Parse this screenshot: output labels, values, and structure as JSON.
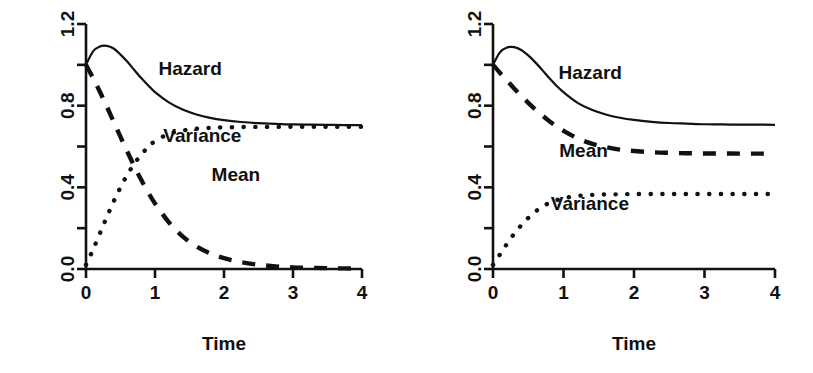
{
  "figure": {
    "title": "",
    "panel_count": 2,
    "background": "#ffffff",
    "ink_color": "#111111"
  },
  "chart_data": [
    {
      "type": "line",
      "panel": "left",
      "title": "",
      "xlabel": "Time",
      "ylabel": "",
      "xlim": [
        0,
        4
      ],
      "ylim": [
        0,
        1.2
      ],
      "grid": false,
      "legend_position": "inline-annotations",
      "xticks": [
        0,
        1,
        2,
        3,
        4
      ],
      "xticklabels": [
        "0",
        "1",
        "2",
        "3",
        "4"
      ],
      "yticks": [
        0.0,
        0.2,
        0.4,
        0.6,
        0.8,
        1.0,
        1.2
      ],
      "yticklabels": [
        "0.0",
        "",
        "0.4",
        "",
        "0.8",
        "",
        "1.2"
      ],
      "x": [
        0.0,
        0.1,
        0.2,
        0.3,
        0.4,
        0.5,
        0.6,
        0.7,
        0.8,
        0.9,
        1.0,
        1.2,
        1.4,
        1.6,
        1.8,
        2.0,
        2.25,
        2.5,
        2.75,
        3.0,
        3.25,
        3.5,
        3.75,
        4.0
      ],
      "series": [
        {
          "name": "Hazard",
          "style": "solid",
          "label_x": 1.05,
          "label_y": 0.95,
          "values": [
            1.0,
            1.065,
            1.09,
            1.093,
            1.08,
            1.05,
            1.015,
            0.975,
            0.935,
            0.9,
            0.866,
            0.816,
            0.781,
            0.757,
            0.74,
            0.729,
            0.72,
            0.714,
            0.711,
            0.708,
            0.707,
            0.706,
            0.705,
            0.705
          ]
        },
        {
          "name": "Mean",
          "style": "dashed",
          "label_x": 1.82,
          "label_y": 0.43,
          "values": [
            1.0,
            0.937,
            0.869,
            0.797,
            0.722,
            0.647,
            0.574,
            0.503,
            0.437,
            0.376,
            0.321,
            0.229,
            0.16,
            0.111,
            0.077,
            0.053,
            0.033,
            0.021,
            0.013,
            0.008,
            0.006,
            0.004,
            0.003,
            0.002
          ]
        },
        {
          "name": "Variance",
          "style": "dotted",
          "label_x": 1.12,
          "label_y": 0.62,
          "values": [
            0.02,
            0.093,
            0.173,
            0.253,
            0.33,
            0.4,
            0.462,
            0.516,
            0.56,
            0.597,
            0.626,
            0.662,
            0.678,
            0.687,
            0.691,
            0.694,
            0.695,
            0.696,
            0.696,
            0.697,
            0.697,
            0.697,
            0.697,
            0.697
          ]
        }
      ]
    },
    {
      "type": "line",
      "panel": "right",
      "title": "",
      "xlabel": "Time",
      "ylabel": "",
      "xlim": [
        0,
        4
      ],
      "ylim": [
        0,
        1.2
      ],
      "grid": false,
      "legend_position": "inline-annotations",
      "xticks": [
        0,
        1,
        2,
        3,
        4
      ],
      "xticklabels": [
        "0",
        "1",
        "2",
        "3",
        "4"
      ],
      "yticks": [
        0.0,
        0.2,
        0.4,
        0.6,
        0.8,
        1.0,
        1.2
      ],
      "yticklabels": [
        "0.0",
        "",
        "0.4",
        "",
        "0.8",
        "",
        "1.2"
      ],
      "x": [
        0.0,
        0.1,
        0.2,
        0.3,
        0.4,
        0.5,
        0.6,
        0.7,
        0.8,
        0.9,
        1.0,
        1.2,
        1.4,
        1.6,
        1.8,
        2.0,
        2.25,
        2.5,
        2.75,
        3.0,
        3.25,
        3.5,
        3.75,
        4.0
      ],
      "series": [
        {
          "name": "Hazard",
          "style": "solid",
          "label_x": 0.93,
          "label_y": 0.93,
          "values": [
            1.0,
            1.062,
            1.085,
            1.087,
            1.073,
            1.046,
            1.012,
            0.974,
            0.934,
            0.898,
            0.866,
            0.814,
            0.78,
            0.757,
            0.741,
            0.73,
            0.721,
            0.715,
            0.712,
            0.709,
            0.708,
            0.707,
            0.707,
            0.706
          ]
        },
        {
          "name": "Mean",
          "style": "dashed",
          "label_x": 0.94,
          "label_y": 0.55,
          "values": [
            1.0,
            0.96,
            0.922,
            0.884,
            0.848,
            0.814,
            0.782,
            0.752,
            0.724,
            0.699,
            0.677,
            0.64,
            0.614,
            0.597,
            0.585,
            0.578,
            0.572,
            0.569,
            0.567,
            0.566,
            0.566,
            0.565,
            0.565,
            0.565
          ]
        },
        {
          "name": "Variance",
          "style": "dotted",
          "label_x": 0.82,
          "label_y": 0.29,
          "values": [
            0.02,
            0.072,
            0.124,
            0.172,
            0.214,
            0.25,
            0.281,
            0.305,
            0.324,
            0.337,
            0.347,
            0.358,
            0.363,
            0.365,
            0.366,
            0.367,
            0.367,
            0.367,
            0.367,
            0.367,
            0.367,
            0.367,
            0.367,
            0.367
          ]
        }
      ]
    }
  ]
}
